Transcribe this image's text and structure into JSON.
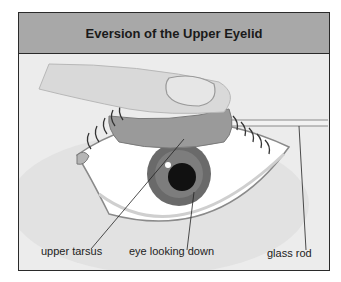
{
  "figure": {
    "title": "Eversion of the Upper Eyelid",
    "labels": {
      "upper_tarsus": "upper tarsus",
      "eye_looking_down": "eye looking down",
      "glass_rod": "glass rod"
    }
  },
  "colors": {
    "header_bg": "#a8a8a8",
    "panel_bg": "#ececec",
    "border": "#2a2a2a",
    "tarsus": "#9a9a9a",
    "iris": "#6a6a6a",
    "pupil": "#111111"
  }
}
